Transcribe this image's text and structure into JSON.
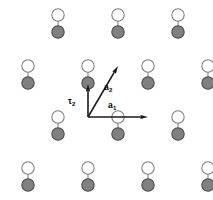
{
  "figure": {
    "width": 213,
    "height": 200,
    "background_color": "#ffffff"
  },
  "style": {
    "atom_a_fill": "#808080",
    "atom_a_stroke": "#4a4a4a",
    "atom_b_fill": "#ffffff",
    "atom_b_stroke": "#7d7d7d",
    "bond_color": "#8a8a8a",
    "vector_color": "#1a1a1a",
    "atom_radius": 6.2,
    "bond_width": 1.15,
    "vector_width": 1.6
  },
  "labels": {
    "a1": {
      "text": "a",
      "sub": "1",
      "x": 108,
      "y": 101
    },
    "a2": {
      "text": "a",
      "sub": "2",
      "x": 104,
      "y": 83
    },
    "tau2": {
      "text": "τ",
      "sub": "2",
      "x": 68,
      "y": 97
    }
  },
  "vectors": [
    {
      "name": "a1",
      "label": "a1",
      "from_x": 88,
      "from_y": 117,
      "to_x": 148,
      "to_y": 117,
      "description": "primitive lattice vector a1, horizontal right"
    },
    {
      "name": "a2",
      "label": "a2",
      "from_x": 88,
      "from_y": 117,
      "to_x": 118,
      "to_y": 66,
      "description": "primitive lattice vector a2, up and to the right"
    },
    {
      "name": "tau2",
      "label": "tau2",
      "from_x": 88,
      "from_y": 117,
      "to_x": 88,
      "to_y": 84,
      "description": "basis vector tau2, vertical up to B sublattice atom"
    }
  ],
  "atoms_a": [
    {
      "x": 58,
      "y": 32
    },
    {
      "x": 118,
      "y": 32
    },
    {
      "x": 178,
      "y": 32
    },
    {
      "x": 28,
      "y": 83
    },
    {
      "x": 88,
      "y": 83
    },
    {
      "x": 148,
      "y": 83
    },
    {
      "x": 208,
      "y": 83
    },
    {
      "x": 58,
      "y": 134
    },
    {
      "x": 118,
      "y": 134
    },
    {
      "x": 178,
      "y": 134
    },
    {
      "x": 28,
      "y": 185
    },
    {
      "x": 88,
      "y": 185
    },
    {
      "x": 148,
      "y": 185
    },
    {
      "x": 208,
      "y": 185
    }
  ],
  "atoms_b": [
    {
      "x": 58,
      "y": 15
    },
    {
      "x": 118,
      "y": 15
    },
    {
      "x": 178,
      "y": 15
    },
    {
      "x": 28,
      "y": 66
    },
    {
      "x": 88,
      "y": 66
    },
    {
      "x": 148,
      "y": 66
    },
    {
      "x": 208,
      "y": 66
    },
    {
      "x": 58,
      "y": 117
    },
    {
      "x": 118,
      "y": 117
    },
    {
      "x": 178,
      "y": 117
    },
    {
      "x": 28,
      "y": 168
    },
    {
      "x": 88,
      "y": 168
    },
    {
      "x": 148,
      "y": 168
    },
    {
      "x": 208,
      "y": 168
    }
  ],
  "node_overrides": {
    "note": "Vector endpoints sit on dark (A-sublattice) sites; tau2 ends on a light (B-sublattice) site",
    "origin_x": 88,
    "origin_y": 117,
    "origin_type": "atom-a"
  }
}
